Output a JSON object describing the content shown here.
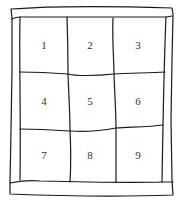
{
  "diagram": {
    "type": "hand-drawn 3x3 numbered grid in a frame",
    "stroke_color": "#1a1a1a",
    "text_color": "#333333",
    "cells": [
      {
        "label": "1",
        "row": 1,
        "col": 1,
        "x": 44,
        "y": 45
      },
      {
        "label": "2",
        "row": 1,
        "col": 2,
        "x": 90,
        "y": 45
      },
      {
        "label": "3",
        "row": 1,
        "col": 3,
        "x": 138,
        "y": 45
      },
      {
        "label": "4",
        "row": 2,
        "col": 1,
        "x": 44,
        "y": 101
      },
      {
        "label": "5",
        "row": 2,
        "col": 2,
        "x": 90,
        "y": 101
      },
      {
        "label": "6",
        "row": 2,
        "col": 3,
        "x": 138,
        "y": 101
      },
      {
        "label": "7",
        "row": 3,
        "col": 1,
        "x": 44,
        "y": 155
      },
      {
        "label": "8",
        "row": 3,
        "col": 2,
        "x": 90,
        "y": 155
      },
      {
        "label": "9",
        "row": 3,
        "col": 3,
        "x": 138,
        "y": 155
      }
    ]
  }
}
